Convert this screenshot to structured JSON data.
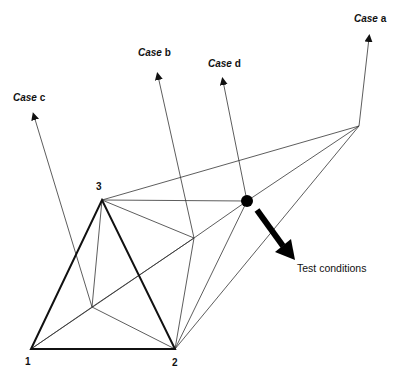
{
  "diagram": {
    "cases": [
      {
        "prefix": "Case",
        "letter": "a"
      },
      {
        "prefix": "Case",
        "letter": "b"
      },
      {
        "prefix": "Case",
        "letter": "c"
      },
      {
        "prefix": "Case",
        "letter": "d"
      }
    ],
    "vertices": [
      "1",
      "2",
      "3"
    ],
    "test_conditions_label": "Test conditions",
    "colors": {
      "line": "#222222",
      "fill": "#000000",
      "background": "#ffffff"
    }
  }
}
